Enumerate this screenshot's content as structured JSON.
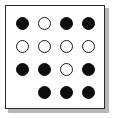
{
  "figure": {
    "frame": {
      "border_color": "#2b2b2b",
      "background_color": "#ffffff",
      "shadow_color": "#b8b8b8"
    },
    "grid": {
      "rows": 4,
      "columns": 4,
      "filled_color": "#0d0d0d",
      "open_color": "#ffffff",
      "open_stroke_color": "#1a1a1a",
      "states_legend": {
        "filled": "filled-dot",
        "open": "open-dot",
        "empty": "no-dot"
      },
      "cells": [
        [
          {
            "state": "filled",
            "label": "row1-col1"
          },
          {
            "state": "open",
            "label": "row1-col2"
          },
          {
            "state": "filled",
            "label": "row1-col3"
          },
          {
            "state": "filled",
            "label": "row1-col4"
          }
        ],
        [
          {
            "state": "open",
            "label": "row2-col1"
          },
          {
            "state": "open",
            "label": "row2-col2"
          },
          {
            "state": "open",
            "label": "row2-col3"
          },
          {
            "state": "open",
            "label": "row2-col4"
          }
        ],
        [
          {
            "state": "filled",
            "label": "row3-col1"
          },
          {
            "state": "filled",
            "label": "row3-col2"
          },
          {
            "state": "open",
            "label": "row3-col3"
          },
          {
            "state": "filled",
            "label": "row3-col4"
          }
        ],
        [
          {
            "state": "empty",
            "label": "row4-col1"
          },
          {
            "state": "filled",
            "label": "row4-col2"
          },
          {
            "state": "filled",
            "label": "row4-col3"
          },
          {
            "state": "filled",
            "label": "row4-col4"
          }
        ]
      ]
    }
  }
}
